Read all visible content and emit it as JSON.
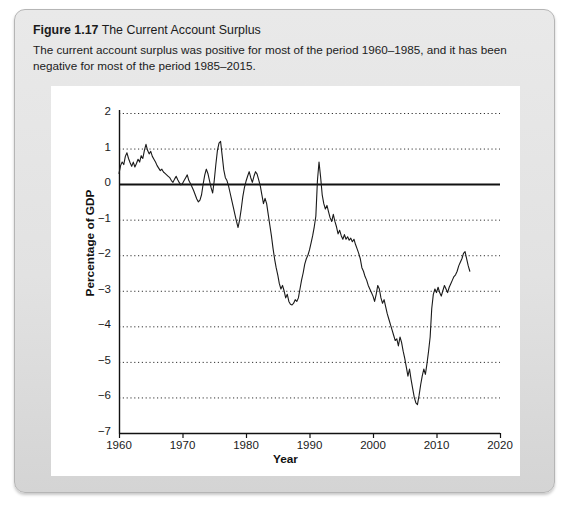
{
  "figure": {
    "number": "Figure 1.17",
    "title": "The Current Account Surplus",
    "subtitle": "The current account surplus was positive for most of the period 1960–1985, and it has been negative for most of the period 1985–2015."
  },
  "chart_data": {
    "type": "line",
    "title": "The Current Account Surplus",
    "xlabel": "Year",
    "ylabel": "Percentage of GDP",
    "xlim": [
      1960,
      2020
    ],
    "ylim": [
      -7,
      2
    ],
    "xticks": [
      1960,
      1970,
      1980,
      1990,
      2000,
      2010,
      2020
    ],
    "yticks": [
      2,
      1,
      0,
      -1,
      -2,
      -3,
      -4,
      -5,
      -6,
      -7
    ],
    "grid": "horizontal-dotted",
    "zero_line": 0,
    "legend": null,
    "series": [
      {
        "name": "Current account surplus (% of GDP)",
        "color": "#1a1a1a",
        "x": [
          1960.0,
          1960.25,
          1960.5,
          1960.75,
          1961.0,
          1961.25,
          1961.5,
          1961.75,
          1962.0,
          1962.25,
          1962.5,
          1962.75,
          1963.0,
          1963.25,
          1963.5,
          1963.75,
          1964.0,
          1964.25,
          1964.5,
          1964.75,
          1965.0,
          1965.25,
          1965.5,
          1965.75,
          1966.0,
          1966.25,
          1966.5,
          1966.75,
          1967.0,
          1967.25,
          1967.5,
          1967.75,
          1968.0,
          1968.25,
          1968.5,
          1968.75,
          1969.0,
          1969.25,
          1969.5,
          1969.75,
          1970.0,
          1970.25,
          1970.5,
          1970.75,
          1971.0,
          1971.25,
          1971.5,
          1971.75,
          1972.0,
          1972.25,
          1972.5,
          1972.75,
          1973.0,
          1973.25,
          1973.5,
          1973.75,
          1974.0,
          1974.25,
          1974.5,
          1974.75,
          1975.0,
          1975.25,
          1975.5,
          1975.75,
          1976.0,
          1976.25,
          1976.5,
          1976.75,
          1977.0,
          1977.25,
          1977.5,
          1977.75,
          1978.0,
          1978.25,
          1978.5,
          1978.75,
          1979.0,
          1979.25,
          1979.5,
          1979.75,
          1980.0,
          1980.25,
          1980.5,
          1980.75,
          1981.0,
          1981.25,
          1981.5,
          1981.75,
          1982.0,
          1982.25,
          1982.5,
          1982.75,
          1983.0,
          1983.25,
          1983.5,
          1983.75,
          1984.0,
          1984.25,
          1984.5,
          1984.75,
          1985.0,
          1985.25,
          1985.5,
          1985.75,
          1986.0,
          1986.25,
          1986.5,
          1986.75,
          1987.0,
          1987.25,
          1987.5,
          1987.75,
          1988.0,
          1988.25,
          1988.5,
          1988.75,
          1989.0,
          1989.25,
          1989.5,
          1989.75,
          1990.0,
          1990.25,
          1990.5,
          1990.75,
          1991.0,
          1991.25,
          1991.5,
          1991.75,
          1992.0,
          1992.25,
          1992.5,
          1992.75,
          1993.0,
          1993.25,
          1993.5,
          1993.75,
          1994.0,
          1994.25,
          1994.5,
          1994.75,
          1995.0,
          1995.25,
          1995.5,
          1995.75,
          1996.0,
          1996.25,
          1996.5,
          1996.75,
          1997.0,
          1997.25,
          1997.5,
          1997.75,
          1998.0,
          1998.25,
          1998.5,
          1998.75,
          1999.0,
          1999.25,
          1999.5,
          1999.75,
          2000.0,
          2000.25,
          2000.5,
          2000.75,
          2001.0,
          2001.25,
          2001.5,
          2001.75,
          2002.0,
          2002.25,
          2002.5,
          2002.75,
          2003.0,
          2003.25,
          2003.5,
          2003.75,
          2004.0,
          2004.25,
          2004.5,
          2004.75,
          2005.0,
          2005.25,
          2005.5,
          2005.75,
          2006.0,
          2006.25,
          2006.5,
          2006.75,
          2007.0,
          2007.25,
          2007.5,
          2007.75,
          2008.0,
          2008.25,
          2008.5,
          2008.75,
          2009.0,
          2009.25,
          2009.5,
          2009.75,
          2010.0,
          2010.25,
          2010.5,
          2010.75,
          2011.0,
          2011.25,
          2011.5,
          2011.75,
          2012.0,
          2012.25,
          2012.5,
          2012.75,
          2013.0,
          2013.25,
          2013.5,
          2013.75,
          2014.0,
          2014.25,
          2014.5,
          2014.75,
          2015.0,
          2015.25
        ],
        "y": [
          0.3,
          0.52,
          0.62,
          0.55,
          0.78,
          0.88,
          0.72,
          0.6,
          0.5,
          0.62,
          0.48,
          0.58,
          0.7,
          0.62,
          0.8,
          0.72,
          0.95,
          1.12,
          0.95,
          0.85,
          0.92,
          0.78,
          0.7,
          0.62,
          0.52,
          0.45,
          0.38,
          0.42,
          0.34,
          0.3,
          0.26,
          0.22,
          0.18,
          0.1,
          0.05,
          0.14,
          0.22,
          0.12,
          0.04,
          -0.02,
          0.02,
          0.1,
          0.18,
          0.26,
          0.1,
          0.02,
          -0.08,
          -0.18,
          -0.3,
          -0.42,
          -0.5,
          -0.45,
          -0.3,
          0.0,
          0.25,
          0.42,
          0.3,
          0.1,
          -0.1,
          -0.25,
          0.1,
          0.55,
          0.95,
          1.15,
          1.2,
          0.8,
          0.4,
          0.18,
          0.1,
          -0.05,
          -0.25,
          -0.45,
          -0.65,
          -0.85,
          -1.05,
          -1.22,
          -1.0,
          -0.7,
          -0.35,
          -0.1,
          0.08,
          0.22,
          0.35,
          0.18,
          0.05,
          0.22,
          0.35,
          0.28,
          0.12,
          -0.05,
          -0.3,
          -0.55,
          -0.4,
          -0.55,
          -0.85,
          -1.15,
          -1.45,
          -1.8,
          -2.1,
          -2.35,
          -2.55,
          -2.8,
          -2.95,
          -2.85,
          -3.0,
          -3.2,
          -3.1,
          -3.3,
          -3.38,
          -3.4,
          -3.35,
          -3.25,
          -3.3,
          -3.2,
          -2.95,
          -2.7,
          -2.5,
          -2.25,
          -2.1,
          -2.0,
          -1.85,
          -1.65,
          -1.45,
          -1.2,
          -0.9,
          0.1,
          0.62,
          0.2,
          -0.3,
          -0.55,
          -0.7,
          -0.6,
          -0.78,
          -0.95,
          -1.05,
          -0.85,
          -1.05,
          -1.2,
          -1.4,
          -1.3,
          -1.45,
          -1.55,
          -1.42,
          -1.55,
          -1.48,
          -1.58,
          -1.52,
          -1.62,
          -1.55,
          -1.7,
          -1.82,
          -1.95,
          -2.1,
          -2.35,
          -2.45,
          -2.6,
          -2.7,
          -2.85,
          -2.95,
          -3.05,
          -3.15,
          -3.3,
          -3.1,
          -2.85,
          -2.95,
          -3.2,
          -3.35,
          -3.25,
          -3.45,
          -3.65,
          -3.8,
          -3.95,
          -4.1,
          -4.25,
          -4.4,
          -4.35,
          -4.55,
          -4.3,
          -4.45,
          -4.7,
          -4.9,
          -5.15,
          -5.4,
          -5.2,
          -5.5,
          -5.75,
          -6.0,
          -6.15,
          -6.2,
          -5.95,
          -5.65,
          -5.4,
          -5.2,
          -5.35,
          -5.05,
          -4.7,
          -4.3,
          -3.5,
          -3.1,
          -2.95,
          -3.05,
          -2.9,
          -3.05,
          -3.15,
          -3.0,
          -2.85,
          -2.95,
          -3.05,
          -2.9,
          -2.8,
          -2.7,
          -2.6,
          -2.55,
          -2.45,
          -2.3,
          -2.2,
          -2.1,
          -1.95,
          -1.9,
          -2.1,
          -2.3,
          -2.45
        ]
      }
    ]
  },
  "axis": {
    "x_title": "Year",
    "y_title": "Percentage of GDP"
  }
}
